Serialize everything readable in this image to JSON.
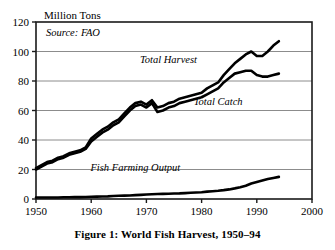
{
  "figure": {
    "caption": "Figure 1: World Fish Harvest, 1950–94",
    "unit_title": "Million Tons",
    "source_note": "Source: FAO"
  },
  "chart_data": {
    "type": "line",
    "title": "Figure 1: World Fish Harvest, 1950–94",
    "subtitle": "",
    "xlabel": "",
    "ylabel": "Million Tons",
    "xlim": [
      1950,
      2000
    ],
    "ylim": [
      0,
      120
    ],
    "xticks": [
      1950,
      1960,
      1970,
      1980,
      1990,
      2000
    ],
    "yticks": [
      0,
      20,
      40,
      60,
      80,
      100,
      120
    ],
    "grid": "horizontal",
    "legend": "inline-annotations",
    "annotations": [
      "Source: FAO"
    ],
    "line_color": "#000000",
    "grid_color": "#8c8c8c",
    "frame_color": "#1a1a1a",
    "x": [
      1950,
      1951,
      1952,
      1953,
      1954,
      1955,
      1956,
      1957,
      1958,
      1959,
      1960,
      1961,
      1962,
      1963,
      1964,
      1965,
      1966,
      1967,
      1968,
      1969,
      1970,
      1971,
      1972,
      1973,
      1974,
      1975,
      1976,
      1977,
      1978,
      1979,
      1980,
      1981,
      1982,
      1983,
      1984,
      1985,
      1986,
      1987,
      1988,
      1989,
      1990,
      1991,
      1992,
      1993,
      1994
    ],
    "series": [
      {
        "name": "Total Harvest",
        "label_x": 1974,
        "label_y": 92,
        "values": [
          21,
          23,
          25,
          26,
          28,
          29,
          31,
          32,
          33,
          35,
          41,
          44,
          47,
          49,
          52,
          54,
          58,
          62,
          65,
          66,
          64,
          67,
          62,
          63,
          65,
          66,
          68,
          69,
          70,
          71,
          72,
          75,
          77,
          79,
          84,
          88,
          92,
          95,
          98,
          100,
          97,
          97,
          100,
          104,
          107
        ]
      },
      {
        "name": "Total Catch",
        "label_x": 1983,
        "label_y": 64,
        "values": [
          20,
          22,
          24,
          25,
          27,
          28,
          30,
          31,
          32,
          34,
          39,
          42,
          45,
          47,
          50,
          52,
          56,
          60,
          63,
          64,
          62,
          65,
          59,
          60,
          62,
          63,
          65,
          66,
          67,
          68,
          69,
          71,
          73,
          75,
          79,
          82,
          85,
          86,
          87,
          87,
          84,
          83,
          83,
          84,
          85
        ]
      },
      {
        "name": "Fish Farming Output",
        "label_x": 1968,
        "label_y": 19,
        "values": [
          1,
          1,
          1,
          1,
          1,
          1.2,
          1.2,
          1.3,
          1.3,
          1.4,
          1.5,
          1.6,
          1.7,
          1.8,
          2,
          2.2,
          2.3,
          2.4,
          2.6,
          2.8,
          3,
          3.2,
          3.4,
          3.5,
          3.6,
          3.7,
          3.8,
          4,
          4.2,
          4.4,
          4.6,
          5,
          5.3,
          5.6,
          6,
          6.5,
          7.2,
          8,
          9,
          10.5,
          11.5,
          12.5,
          13.5,
          14.3,
          15
        ]
      }
    ]
  }
}
